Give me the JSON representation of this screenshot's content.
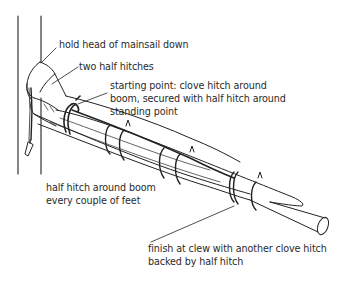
{
  "diagram": {
    "ink_color": "#222222",
    "background_color": "#ffffff",
    "labels": [
      {
        "id": "head",
        "lines": [
          "hold head of mainsail down"
        ]
      },
      {
        "id": "two-half-hitches",
        "lines": [
          "two half hitches"
        ]
      },
      {
        "id": "starting-point",
        "lines": [
          "starting point: clove hitch around",
          "boom, secured with half hitch around",
          "standing point"
        ]
      },
      {
        "id": "half-hitch-boom",
        "lines": [
          "half hitch around boom",
          "every couple of feet"
        ]
      },
      {
        "id": "finish",
        "lines": [
          "finish at clew with another clove hitch",
          "backed by half hitch"
        ]
      }
    ]
  }
}
